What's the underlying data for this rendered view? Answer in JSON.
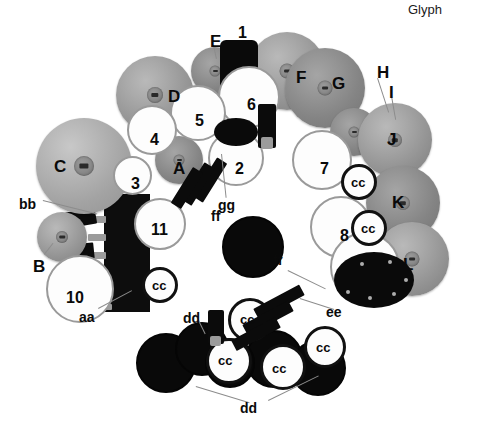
{
  "figure": {
    "corner_text": "Glyph",
    "background_color": "#ffffff",
    "width": 479,
    "height": 431
  },
  "cymbal_labels": [
    {
      "id": "A",
      "text": "A",
      "x": 173,
      "y": 160
    },
    {
      "id": "B",
      "text": "B",
      "x": 33,
      "y": 258
    },
    {
      "id": "C",
      "text": "C",
      "x": 54,
      "y": 158
    },
    {
      "id": "D",
      "text": "D",
      "x": 168,
      "y": 88
    },
    {
      "id": "E",
      "text": "E",
      "x": 210,
      "y": 33
    },
    {
      "id": "F",
      "text": "F",
      "x": 296,
      "y": 69
    },
    {
      "id": "G",
      "text": "G",
      "x": 332,
      "y": 75
    },
    {
      "id": "H",
      "text": "H",
      "x": 377,
      "y": 64
    },
    {
      "id": "I",
      "text": "I",
      "x": 389,
      "y": 84
    },
    {
      "id": "J",
      "text": "J",
      "x": 387,
      "y": 131
    },
    {
      "id": "K",
      "text": "K",
      "x": 392,
      "y": 194
    },
    {
      "id": "L",
      "text": "L",
      "x": 403,
      "y": 256
    }
  ],
  "drum_labels": [
    {
      "id": "1",
      "text": "1",
      "x": 238,
      "y": 25
    },
    {
      "id": "2",
      "text": "2",
      "x": 235,
      "y": 161
    },
    {
      "id": "3",
      "text": "3",
      "x": 131,
      "y": 176
    },
    {
      "id": "4",
      "text": "4",
      "x": 150,
      "y": 132
    },
    {
      "id": "5",
      "text": "5",
      "x": 195,
      "y": 113
    },
    {
      "id": "6",
      "text": "6",
      "x": 247,
      "y": 97
    },
    {
      "id": "7",
      "text": "7",
      "x": 320,
      "y": 161
    },
    {
      "id": "8",
      "text": "8",
      "x": 340,
      "y": 228
    },
    {
      "id": "9",
      "text": "9",
      "x": 363,
      "y": 266
    },
    {
      "id": "10",
      "text": "10",
      "x": 72,
      "y": 290
    },
    {
      "id": "11",
      "text": "11",
      "x": 157,
      "y": 222
    }
  ],
  "part_labels": [
    {
      "id": "aa",
      "text": "aa",
      "x": 79,
      "y": 310
    },
    {
      "id": "bb",
      "text": "bb",
      "x": 19,
      "y": 197
    },
    {
      "id": "cc1",
      "text": "cc",
      "x": 357,
      "y": 181
    },
    {
      "id": "cc2",
      "text": "cc",
      "x": 367,
      "y": 227
    },
    {
      "id": "cc3",
      "text": "cc",
      "x": 158,
      "y": 284
    },
    {
      "id": "cc4",
      "text": "cc",
      "x": 243,
      "y": 318
    },
    {
      "id": "cc5",
      "text": "cc",
      "x": 322,
      "y": 345
    },
    {
      "id": "cc6",
      "text": "cc",
      "x": 224,
      "y": 358
    },
    {
      "id": "cc7",
      "text": "cc",
      "x": 278,
      "y": 366
    },
    {
      "id": "dd1",
      "text": "dd",
      "x": 188,
      "y": 316
    },
    {
      "id": "dd2",
      "text": "dd",
      "x": 244,
      "y": 406
    },
    {
      "id": "ee",
      "text": "ee",
      "x": 331,
      "y": 310
    },
    {
      "id": "ff1",
      "text": "ff",
      "x": 211,
      "y": 213
    },
    {
      "id": "ff2",
      "text": "ff",
      "x": 273,
      "y": 258
    },
    {
      "id": "gg",
      "text": "gg",
      "x": 223,
      "y": 202
    }
  ],
  "colors": {
    "background": "#ffffff",
    "label_text": "#0a0a0a",
    "cymbal_mid": "#9a9a9a",
    "cymbal_dark": "#7e7e7e",
    "drum_head": "#fdfdfd",
    "drum_rim": "#9a9a9a",
    "shell_black": "#0a0a0a",
    "leader_line": "#8c8c8c"
  }
}
